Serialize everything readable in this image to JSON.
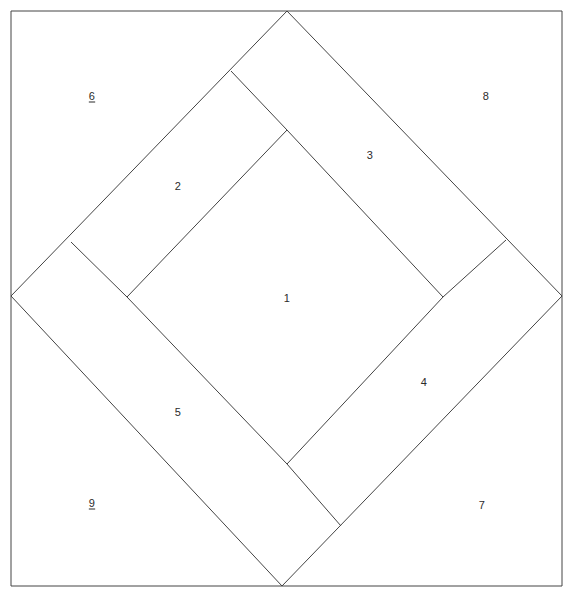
{
  "figure": {
    "type": "geometric-region-diagram",
    "width": 574,
    "height": 599,
    "background_color": "#ffffff",
    "stroke_color": "#444444",
    "stroke_width": 1,
    "label_color": "#2b2b2b"
  },
  "outer_square": {
    "name": "outer-square",
    "left": 11,
    "top": 11,
    "right": 562,
    "bottom": 586,
    "points": "11,11 562,11 562,586 11,586"
  },
  "diamond": {
    "name": "inscribed-diamond",
    "points": "287,11 562,296 282,586 11,296",
    "vertices": {
      "top": [
        287,
        11
      ],
      "right": [
        562,
        296
      ],
      "bottom": [
        282,
        586
      ],
      "left": [
        11,
        296
      ]
    }
  },
  "inner_square": {
    "name": "inner-rotated-square",
    "points": "287,130 443,297 287,464 127,297",
    "vertices": {
      "top": [
        287,
        130
      ],
      "right": [
        443,
        297
      ],
      "bottom": [
        287,
        464
      ],
      "left": [
        127,
        297
      ]
    }
  },
  "band_lines": [
    {
      "name": "band-line-upper-left",
      "x1": 231,
      "y1": 71,
      "x2": 287,
      "y2": 130
    },
    {
      "name": "band-line-upper-left-outer",
      "x1": 71,
      "y1": 242,
      "x2": 127,
      "y2": 297
    },
    {
      "name": "band-line-upper-right",
      "x1": 506,
      "y1": 240,
      "x2": 443,
      "y2": 297
    },
    {
      "name": "band-line-lower-right",
      "x1": 341,
      "y1": 526,
      "x2": 287,
      "y2": 464
    }
  ],
  "labels": [
    {
      "id": "region-1",
      "text": "1",
      "x": 287,
      "y": 298,
      "underlined": false
    },
    {
      "id": "region-2",
      "text": "2",
      "x": 178,
      "y": 186,
      "underlined": false
    },
    {
      "id": "region-3",
      "text": "3",
      "x": 370,
      "y": 155,
      "underlined": false
    },
    {
      "id": "region-4",
      "text": "4",
      "x": 424,
      "y": 382,
      "underlined": false
    },
    {
      "id": "region-5",
      "text": "5",
      "x": 178,
      "y": 412,
      "underlined": false
    },
    {
      "id": "region-6",
      "text": "6",
      "x": 92,
      "y": 96,
      "underlined": true
    },
    {
      "id": "region-7",
      "text": "7",
      "x": 482,
      "y": 505,
      "underlined": false
    },
    {
      "id": "region-8",
      "text": "8",
      "x": 486,
      "y": 96,
      "underlined": false
    },
    {
      "id": "region-9",
      "text": "9",
      "x": 92,
      "y": 503,
      "underlined": true
    }
  ]
}
